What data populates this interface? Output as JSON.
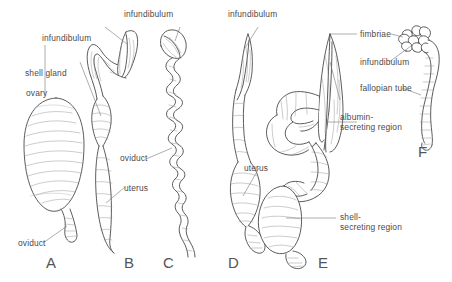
{
  "figure": {
    "caption_letters": [
      "A",
      "B",
      "C",
      "D",
      "E",
      "F"
    ],
    "ink_color": "#3f3f3f",
    "label_color": "#4a4a4a",
    "background_color": "#ffffff"
  },
  "labels": {
    "infundibulum_b": "infundibulum",
    "shell_gland": "shell gland",
    "ovary": "ovary",
    "oviduct_a": "oviduct",
    "infundibulum_c": "infundibulum",
    "oviduct_c": "oviduct",
    "uterus_b": "uterus",
    "infundibulum_d": "infundibulum",
    "uterus_d": "uterus",
    "fimbriae": "fimbriae",
    "infundibulum_e": "infundibulum",
    "fallopian_tube": "fallopian tube",
    "albumin_region_line1": "albumin-",
    "albumin_region_line2": "secreting region",
    "shell_region_line1": "shell-",
    "shell_region_line2": "secreting region"
  },
  "panels": {
    "a": {
      "letter": "A"
    },
    "b": {
      "letter": "B"
    },
    "c": {
      "letter": "C"
    },
    "d": {
      "letter": "D"
    },
    "e": {
      "letter": "E"
    },
    "f": {
      "letter": "F"
    }
  }
}
